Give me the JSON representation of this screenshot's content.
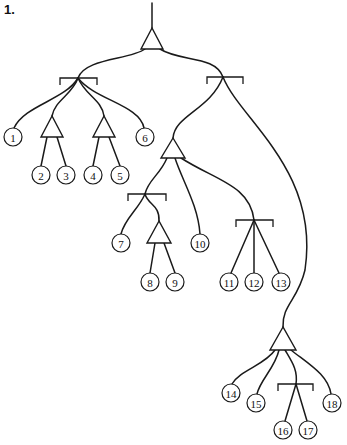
{
  "figure": {
    "label": "1."
  },
  "nodes": {
    "root": {
      "type": "triangle",
      "apex": [
        152,
        28
      ],
      "base_y": 49,
      "half_width": 11
    },
    "bracket_left": {
      "type": "bracket",
      "x1": 60,
      "x2": 97,
      "y": 78,
      "join": [
        78,
        78
      ]
    },
    "bracket_right": {
      "type": "bracket",
      "x1": 207,
      "x2": 243,
      "y": 77,
      "join": [
        223,
        77
      ]
    },
    "tri_2_3": {
      "type": "triangle",
      "apex": [
        52,
        116
      ],
      "base_y": 137,
      "half_width": 11
    },
    "tri_4_5": {
      "type": "triangle",
      "apex": [
        104,
        116
      ],
      "base_y": 137,
      "half_width": 11
    },
    "tri_mid": {
      "type": "triangle",
      "apex": [
        173,
        138
      ],
      "base_y": 158,
      "half_width": 12
    },
    "bracket_7_9": {
      "type": "bracket",
      "x1": 128,
      "x2": 166,
      "y": 194,
      "join": [
        145,
        194
      ]
    },
    "tri_8_9": {
      "type": "triangle",
      "apex": [
        159,
        221
      ],
      "base_y": 243,
      "half_width": 12
    },
    "bracket_11_13": {
      "type": "bracket",
      "x1": 236,
      "x2": 273,
      "y": 220,
      "join": [
        254,
        220
      ]
    },
    "tri_bottom": {
      "type": "triangle",
      "apex": [
        283,
        327
      ],
      "base_y": 350,
      "half_width": 13
    },
    "bracket_16_17": {
      "type": "bracket",
      "x1": 278,
      "x2": 313,
      "y": 384,
      "join": [
        296,
        384
      ]
    }
  },
  "leaves": [
    {
      "label": "1",
      "cx": 13,
      "cy": 137
    },
    {
      "label": "2",
      "cx": 41,
      "cy": 175
    },
    {
      "label": "3",
      "cx": 66,
      "cy": 175
    },
    {
      "label": "4",
      "cx": 93,
      "cy": 175
    },
    {
      "label": "5",
      "cx": 120,
      "cy": 175
    },
    {
      "label": "6",
      "cx": 145,
      "cy": 137
    },
    {
      "label": "7",
      "cx": 121,
      "cy": 243
    },
    {
      "label": "8",
      "cx": 150,
      "cy": 282
    },
    {
      "label": "9",
      "cx": 175,
      "cy": 282
    },
    {
      "label": "10",
      "cx": 200,
      "cy": 243
    },
    {
      "label": "11",
      "cx": 229,
      "cy": 282
    },
    {
      "label": "12",
      "cx": 254,
      "cy": 282
    },
    {
      "label": "13",
      "cx": 281,
      "cy": 282
    },
    {
      "label": "14",
      "cx": 231,
      "cy": 393
    },
    {
      "label": "15",
      "cx": 256,
      "cy": 403
    },
    {
      "label": "16",
      "cx": 283,
      "cy": 430
    },
    {
      "label": "17",
      "cx": 308,
      "cy": 430
    },
    {
      "label": "18",
      "cx": 332,
      "cy": 403
    }
  ],
  "edges": [
    "M152 3 L152 28",
    "M145 49 C130 60 85 58 78 78",
    "M160 49 C180 62 215 55 223 77",
    "M78 78 C65 100 25 105 14 128",
    "M78 78 C72 95 55 100 52 116",
    "M78 78 C85 95 102 100 104 116",
    "M78 78 C95 100 140 105 144 128",
    "M47 137 L41 166",
    "M57 137 L66 166",
    "M99 137 L93 166",
    "M109 137 L120 166",
    "M223 77 C210 110 175 115 173 138",
    "M223 77 C240 120 320 170 305 270 C298 300 282 305 283 327",
    "M167 158 C160 175 148 180 145 194",
    "M175 158 C182 180 198 205 200 234",
    "M181 158 C215 180 250 185 254 220",
    "M145 194 C138 210 125 218 121 234",
    "M145 194 C148 205 160 205 159 221",
    "M155 243 L150 273",
    "M164 243 L175 273",
    "M254 220 L231 273",
    "M254 220 L254 273",
    "M254 220 L279 273",
    "M275 350 C265 365 240 370 232 384",
    "M279 350 C275 368 260 380 257 394",
    "M285 350 C292 362 298 370 296 384",
    "M291 350 C310 365 328 375 331 394",
    "M296 384 L285 421",
    "M296 384 L307 421"
  ]
}
